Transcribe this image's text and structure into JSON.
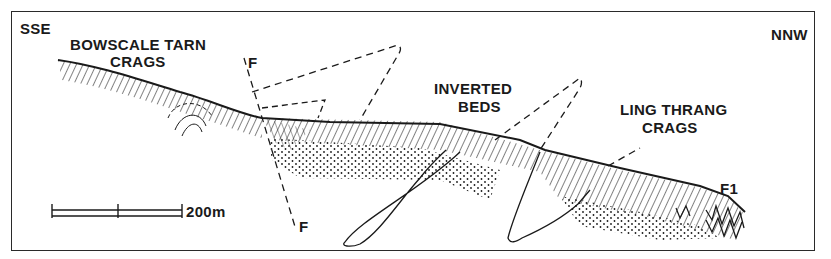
{
  "figure": {
    "type": "geological cross-section",
    "orientation": {
      "left": "SSE",
      "right": "NNW"
    },
    "labels": {
      "bowscale_line1": "BOWSCALE TARN",
      "bowscale_line2": "CRAGS",
      "inverted_line1": "INVERTED",
      "inverted_line2": "BEDS",
      "ling_line1": "LING THRANG",
      "ling_line2": "CRAGS",
      "fault_top": "F",
      "fault_bottom": "F",
      "fold": "F1"
    },
    "scale_bar": {
      "label": "200m",
      "divisions": 2
    },
    "colors": {
      "ink": "#1a1a1a",
      "background": "#ffffff"
    }
  }
}
